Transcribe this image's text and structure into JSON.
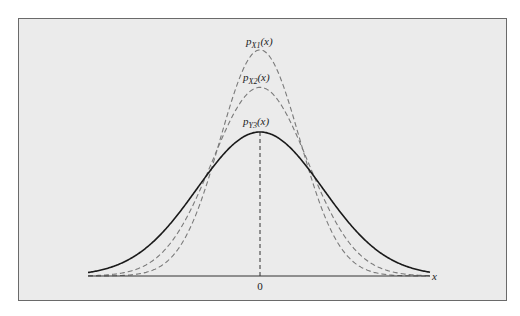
{
  "chart_data": {
    "type": "line",
    "title": "",
    "xlabel": "x",
    "ylabel": "",
    "x_ticks": [
      "0"
    ],
    "grid": false,
    "legend": "inline labels above each peak",
    "series": [
      {
        "name": "p_X1(x)",
        "label_main": "p",
        "label_sub": "X1",
        "label_arg": "(x)",
        "style": "dashed",
        "color": "#7a7a7a",
        "mean": 0,
        "relative_sigma": 0.63,
        "relative_peak": 1.57
      },
      {
        "name": "p_X2(x)",
        "label_main": "p",
        "label_sub": "X2",
        "label_arg": "(x)",
        "style": "dashed",
        "color": "#7a7a7a",
        "mean": 0,
        "relative_sigma": 0.76,
        "relative_peak": 1.31
      },
      {
        "name": "p_Y3(x)",
        "label_main": "p",
        "label_sub": "Y3",
        "label_arg": "(x)",
        "style": "solid",
        "color": "#1a1a1a",
        "mean": 0,
        "relative_sigma": 1.0,
        "relative_peak": 1.0
      }
    ],
    "annotations": [
      "vertical dashed line at x = 0 from baseline to peak of p_Y3(x)"
    ]
  },
  "colors": {
    "panel_bg": "#ebebeb",
    "panel_border": "#6a6a6a",
    "solid_curve": "#1a1a1a",
    "dashed_curve": "#7a7a7a",
    "axis": "#333333"
  }
}
